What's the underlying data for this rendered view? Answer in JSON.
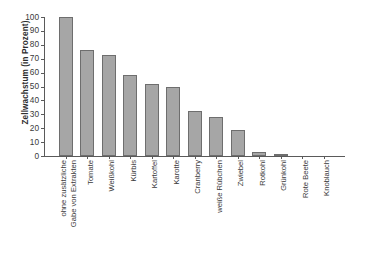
{
  "chart_data": {
    "type": "bar",
    "title": "",
    "subtitle": "",
    "xlabel": "",
    "ylabel": "Zellwachstum (in Prozent)",
    "ylim": [
      0,
      100
    ],
    "yticks": [
      0,
      10,
      20,
      30,
      40,
      50,
      60,
      70,
      80,
      90,
      100
    ],
    "ytick_labels": [
      "0",
      "10",
      "20",
      "30",
      "40",
      "50",
      "60",
      "70",
      "80",
      "90",
      "100"
    ],
    "grid": false,
    "legend": false,
    "legend_position": "none",
    "bar_color": "#a6a6a6",
    "bar_edge_color": "#6e6e6e",
    "axis_color": "#5a5a5a",
    "categories": [
      "ohne zusätzliche Gabe von Extrakten",
      "Tomate",
      "Weißkohl",
      "Kürbis",
      "Kartoffel",
      "Karotte",
      "Cranberry",
      "weiße Rübchen",
      "Zwiebel",
      "Rotkohl",
      "Grünkohl",
      "Rote Beete",
      "Knoblauch"
    ],
    "category_lines": [
      [
        "ohne zusätzliche",
        "Gabe von Extrakten"
      ],
      [
        "Tomate"
      ],
      [
        "Weißkohl"
      ],
      [
        "Kürbis"
      ],
      [
        "Kartoffel"
      ],
      [
        "Karotte"
      ],
      [
        "Cranberry"
      ],
      [
        "weiße Rübchen"
      ],
      [
        "Zwiebel"
      ],
      [
        "Rotkohl"
      ],
      [
        "Grünkohl"
      ],
      [
        "Rote Beete"
      ],
      [
        "Knoblauch"
      ]
    ],
    "values": [
      100,
      76.5,
      73,
      58,
      51.5,
      50,
      32.5,
      28,
      18.5,
      3,
      1,
      0,
      0
    ]
  }
}
